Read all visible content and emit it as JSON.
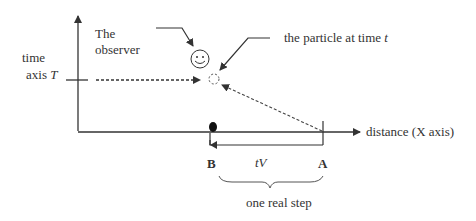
{
  "diagram": {
    "time_axis_label_line1": "time",
    "time_axis_label_line2": "axis",
    "time_axis_symbol": "T",
    "observer_label_line1": "The",
    "observer_label_line2": "observer",
    "particle_label": "the particle at time",
    "particle_label_symbol": "t",
    "x_axis_label": "distance (X axis)",
    "point_b": "B",
    "point_a": "A",
    "displacement_label": "tV",
    "brace_label": "one real step",
    "icons": [
      "smiley-face-observer",
      "dashed-circle-particle",
      "filled-dot-particle"
    ]
  }
}
